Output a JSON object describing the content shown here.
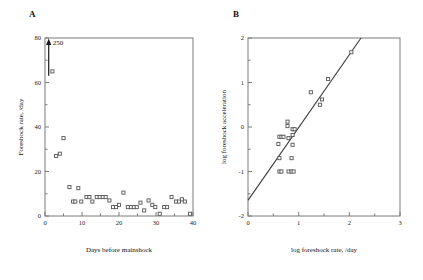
{
  "figure": {
    "panels": [
      {
        "letter": "A"
      },
      {
        "letter": "B"
      }
    ]
  },
  "chart_data": [
    {
      "type": "scatter",
      "panel": "A",
      "title": "",
      "xlabel": "Days before mainshock",
      "ylabel": "Foreshock rate, /day",
      "xlim": [
        0,
        40
      ],
      "ylim": [
        0,
        80
      ],
      "xticks": [
        0,
        10,
        20,
        30,
        40
      ],
      "xticklabels": [
        "0",
        "10",
        "20",
        "30",
        "40"
      ],
      "xminorticks": [
        5,
        15,
        25,
        35
      ],
      "yticks": [
        0,
        20,
        40,
        60,
        80
      ],
      "yticklabels": [
        "0",
        "20",
        "40",
        "60",
        "80"
      ],
      "yminorticks": [
        10,
        30,
        50,
        70
      ],
      "grid": false,
      "legend": "none",
      "marker": "open-square",
      "annotations": [
        {
          "name": "offscale-arrow-label",
          "text": "250",
          "x": 2.1,
          "y": 78.0
        },
        {
          "name": "offscale-arrow",
          "text": "",
          "x": 1.0,
          "y": 80.0
        }
      ],
      "arrow": {
        "x": 1.0,
        "y_start": 63.0,
        "y_end": 80.0,
        "value": 250
      },
      "points": [
        {
          "x": 2.0,
          "y": 65.0
        },
        {
          "x": 3.0,
          "y": 27.0
        },
        {
          "x": 4.0,
          "y": 28.0
        },
        {
          "x": 5.0,
          "y": 35.0
        },
        {
          "x": 6.6,
          "y": 13.0
        },
        {
          "x": 7.6,
          "y": 6.5
        },
        {
          "x": 8.2,
          "y": 6.5
        },
        {
          "x": 9.0,
          "y": 12.5
        },
        {
          "x": 9.8,
          "y": 6.5
        },
        {
          "x": 11.2,
          "y": 8.5
        },
        {
          "x": 12.0,
          "y": 8.5
        },
        {
          "x": 12.8,
          "y": 6.5
        },
        {
          "x": 14.0,
          "y": 8.5
        },
        {
          "x": 14.8,
          "y": 8.5
        },
        {
          "x": 15.6,
          "y": 8.5
        },
        {
          "x": 16.4,
          "y": 8.5
        },
        {
          "x": 17.4,
          "y": 7.0
        },
        {
          "x": 18.4,
          "y": 4.0
        },
        {
          "x": 19.2,
          "y": 4.0
        },
        {
          "x": 20.0,
          "y": 5.0
        },
        {
          "x": 21.2,
          "y": 10.5
        },
        {
          "x": 22.4,
          "y": 4.0
        },
        {
          "x": 23.2,
          "y": 4.0
        },
        {
          "x": 24.0,
          "y": 4.0
        },
        {
          "x": 24.8,
          "y": 4.0
        },
        {
          "x": 25.8,
          "y": 6.0
        },
        {
          "x": 26.8,
          "y": 2.5
        },
        {
          "x": 28.0,
          "y": 7.0
        },
        {
          "x": 29.0,
          "y": 5.0
        },
        {
          "x": 29.8,
          "y": 4.0
        },
        {
          "x": 31.0,
          "y": 1.0
        },
        {
          "x": 32.2,
          "y": 4.0
        },
        {
          "x": 33.0,
          "y": 4.0
        },
        {
          "x": 34.2,
          "y": 8.5
        },
        {
          "x": 35.4,
          "y": 6.5
        },
        {
          "x": 36.2,
          "y": 6.5
        },
        {
          "x": 37.0,
          "y": 7.5
        },
        {
          "x": 37.8,
          "y": 6.5
        },
        {
          "x": 39.2,
          "y": 1.0
        }
      ]
    },
    {
      "type": "scatter",
      "panel": "B",
      "title": "",
      "xlabel": "log foreshock rate, /day",
      "ylabel": "log foreshock acceleration",
      "xlim": [
        0,
        3
      ],
      "ylim": [
        -2,
        2
      ],
      "xticks": [
        0,
        1,
        2,
        3
      ],
      "xticklabels": [
        "0",
        "1",
        "2",
        "3"
      ],
      "xminorticks": [
        0.5,
        1.5,
        2.5
      ],
      "yticks": [
        -2,
        -1,
        0,
        1,
        2
      ],
      "yticklabels": [
        "-2",
        "-1",
        "0",
        "1",
        "2"
      ],
      "yminorticks": [
        -1.5,
        -0.5,
        0.5,
        1.5
      ],
      "grid": false,
      "legend": "none",
      "marker": "open-square",
      "fit_line": {
        "x_start": 0.0,
        "y_start": -1.65,
        "x_end": 2.23,
        "y_end": 2.0
      },
      "points": [
        {
          "x": 0.6,
          "y": -0.38
        },
        {
          "x": 0.62,
          "y": -0.22
        },
        {
          "x": 0.66,
          "y": -0.22
        },
        {
          "x": 0.7,
          "y": -0.22
        },
        {
          "x": 0.62,
          "y": -0.7
        },
        {
          "x": 0.62,
          "y": -1.0
        },
        {
          "x": 0.66,
          "y": -1.0
        },
        {
          "x": 0.78,
          "y": 0.12
        },
        {
          "x": 0.78,
          "y": 0.02
        },
        {
          "x": 0.8,
          "y": -0.25
        },
        {
          "x": 0.8,
          "y": -1.0
        },
        {
          "x": 0.86,
          "y": -1.0
        },
        {
          "x": 0.9,
          "y": -1.0
        },
        {
          "x": 0.88,
          "y": -0.05
        },
        {
          "x": 0.92,
          "y": -0.05
        },
        {
          "x": 0.88,
          "y": -0.18
        },
        {
          "x": 0.88,
          "y": -0.4
        },
        {
          "x": 0.86,
          "y": -0.7
        },
        {
          "x": 1.24,
          "y": 0.78
        },
        {
          "x": 1.42,
          "y": 0.5
        },
        {
          "x": 1.46,
          "y": 0.62
        },
        {
          "x": 1.58,
          "y": 1.08
        },
        {
          "x": 2.04,
          "y": 1.68
        }
      ]
    }
  ]
}
